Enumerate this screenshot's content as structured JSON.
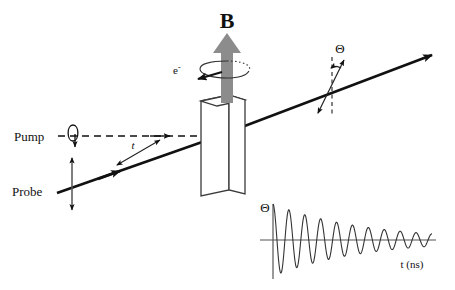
{
  "figure": {
    "labels": {
      "pump": "Pump",
      "probe": "Probe",
      "magnetic_field": "B",
      "electron": "e",
      "electron_superscript": "-",
      "delay_time": "t",
      "rotation_angle": "Θ",
      "plot_y_axis": "Θ",
      "plot_x_axis": "t (ns)"
    },
    "colors": {
      "line": "#111111",
      "field_arrow": "#8c8c8c",
      "axis": "#555555",
      "trace": "#333333",
      "background": "#ffffff"
    },
    "elements": {
      "pump_beam_style": "dashed",
      "probe_beam_style": "solid",
      "pump_polarization": "circular",
      "probe_polarization": "linear-vertical",
      "output_polarization": "linear-rotated",
      "sample": "crystal-slab"
    }
  },
  "chart_data": {
    "type": "line",
    "title": "",
    "xlabel": "t (ns)",
    "ylabel": "Θ",
    "x": [
      0.0,
      0.08,
      0.16,
      0.24,
      0.32,
      0.4,
      0.48,
      0.56,
      0.64,
      0.72,
      0.8,
      0.88,
      0.96,
      1.04,
      1.12,
      1.2,
      1.28,
      1.36,
      1.44,
      1.52,
      1.6,
      1.68,
      1.76,
      1.84,
      1.92,
      2.0,
      2.08,
      2.16,
      2.24,
      2.32,
      2.4,
      2.48,
      2.56,
      2.64,
      2.72,
      2.8,
      2.88,
      2.96,
      3.04,
      3.12,
      3.2,
      3.28,
      3.36,
      3.44,
      3.52,
      3.6,
      3.68,
      3.76,
      3.84,
      3.92,
      4.0
    ],
    "values": [
      1.0,
      0.32,
      -0.63,
      -0.94,
      -0.23,
      0.7,
      0.83,
      0.1,
      -0.66,
      -0.72,
      -0.02,
      0.62,
      0.63,
      -0.03,
      -0.59,
      -0.55,
      0.06,
      0.55,
      0.48,
      -0.1,
      -0.51,
      -0.41,
      0.13,
      0.48,
      0.35,
      -0.16,
      -0.44,
      -0.29,
      0.18,
      0.41,
      0.24,
      -0.2,
      -0.38,
      -0.2,
      0.21,
      0.35,
      0.16,
      -0.22,
      -0.32,
      -0.12,
      0.22,
      0.29,
      0.09,
      -0.22,
      -0.26,
      -0.07,
      0.22,
      0.24,
      0.04,
      -0.21,
      0.3
    ],
    "ylim": [
      -1.05,
      1.05
    ],
    "xlim": [
      0,
      4.2
    ],
    "grid": false,
    "legend": "none",
    "damping_constant": 0.42,
    "oscillation_periods": 10,
    "series": [
      {
        "name": "Θ(t)",
        "values": [
          1.0,
          0.32,
          -0.63,
          -0.94,
          -0.23,
          0.7,
          0.83,
          0.1,
          -0.66,
          -0.72,
          -0.02,
          0.62,
          0.63,
          -0.03,
          -0.59,
          -0.55,
          0.06,
          0.55,
          0.48,
          -0.1,
          -0.51,
          -0.41,
          0.13,
          0.48,
          0.35,
          -0.16,
          -0.44,
          -0.29,
          0.18,
          0.41,
          0.24,
          -0.2,
          -0.38,
          -0.2,
          0.21,
          0.35,
          0.16,
          -0.22,
          -0.32,
          -0.12,
          0.22,
          0.29,
          0.09,
          -0.22,
          -0.26,
          -0.07,
          0.22,
          0.24,
          0.04,
          -0.21,
          0.3
        ]
      }
    ]
  }
}
